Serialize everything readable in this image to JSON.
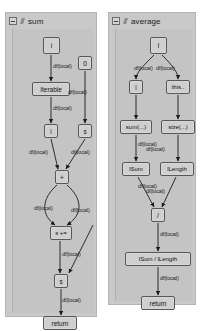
{
  "window": {
    "background": "#ffffff",
    "panel_bg": "#c9c9c9",
    "node_bg": "#cfcfcf",
    "node_border": "#575757",
    "edge_color": "#1c1c1c"
  },
  "panels": [
    {
      "id": "sum",
      "title": "sum",
      "collapse_icon": "collapse-minus-icon",
      "kind_icon": "method-glyph-icon",
      "nodes": [
        {
          "id": "sum-param",
          "label": "i",
          "name": "node-parameter-i"
        },
        {
          "id": "sum-iterable",
          "label": "Iterable",
          "name": "node-iterable"
        },
        {
          "id": "sum-zero",
          "label": "0",
          "name": "node-literal-zero"
        },
        {
          "id": "sum-i",
          "label": "i",
          "name": "node-variable-i"
        },
        {
          "id": "sum-s",
          "label": "s",
          "name": "node-variable-s"
        },
        {
          "id": "sum-plus",
          "label": "+",
          "name": "node-operator-plus"
        },
        {
          "id": "sum-splus",
          "label": "s +=",
          "name": "node-assign-splus"
        },
        {
          "id": "sum-s2",
          "label": "s",
          "name": "node-variable-s-result"
        },
        {
          "id": "sum-return",
          "label": "return",
          "name": "node-return"
        }
      ],
      "edge_labels": [
        "df(local)",
        "df(local)",
        "df(local)",
        "df(local)",
        "df(local)",
        "df(local)",
        "df(local)",
        "df(local)",
        "df(local)"
      ]
    },
    {
      "id": "average",
      "title": "average",
      "collapse_icon": "collapse-minus-icon",
      "kind_icon": "method-glyph-icon",
      "nodes": [
        {
          "id": "avg-param",
          "label": "l",
          "name": "node-parameter-l"
        },
        {
          "id": "avg-l",
          "label": "l",
          "name": "node-variable-l"
        },
        {
          "id": "avg-this",
          "label": "this..",
          "name": "node-this"
        },
        {
          "id": "avg-sum",
          "label": "sum(...)",
          "name": "node-call-sum"
        },
        {
          "id": "avg-size",
          "label": "size(...)",
          "name": "node-call-size"
        },
        {
          "id": "avg-lsum",
          "label": "lSum",
          "name": "node-variable-lsum"
        },
        {
          "id": "avg-llength",
          "label": "lLength",
          "name": "node-variable-llength"
        },
        {
          "id": "avg-div",
          "label": "/",
          "name": "node-operator-divide"
        },
        {
          "id": "avg-expr",
          "label": "lSum / lLength",
          "name": "node-expression-quotient"
        },
        {
          "id": "avg-return",
          "label": "return",
          "name": "node-return"
        }
      ],
      "edge_labels": [
        "df(local)",
        "df(local)",
        "df(local)",
        "df(local)",
        "df(local)",
        "df(local)",
        "df(local)",
        "df(local)",
        "df(local)"
      ]
    }
  ]
}
